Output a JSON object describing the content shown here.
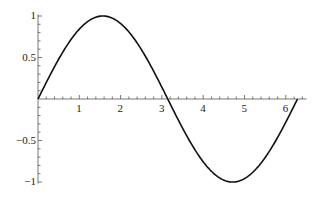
{
  "chart_data": {
    "type": "line",
    "title": "",
    "xlabel": "",
    "ylabel": "",
    "function": "sin(x)",
    "x_range": [
      0,
      6.2832
    ],
    "xlim": [
      0,
      6.5
    ],
    "ylim": [
      -1,
      1
    ],
    "grid": false,
    "legend": null,
    "x_ticks": [
      1,
      2,
      3,
      4,
      5,
      6
    ],
    "x_tick_labels": [
      "1",
      "2",
      "3",
      "4",
      "5",
      "6"
    ],
    "y_ticks": [
      -1,
      -0.5,
      0.5,
      1
    ],
    "y_tick_labels": [
      "-1",
      "-0.5",
      "0.5",
      "1"
    ],
    "series": [
      {
        "name": "sin(x)",
        "color": "#111111",
        "x": [
          0,
          0.5,
          1.0,
          1.5708,
          2.0,
          2.5,
          3.1416,
          3.5,
          4.0,
          4.7124,
          5.0,
          5.5,
          6.0,
          6.2832
        ],
        "y": [
          0,
          0.479,
          0.841,
          1.0,
          0.909,
          0.598,
          0,
          -0.351,
          -0.757,
          -1.0,
          -0.959,
          -0.706,
          -0.279,
          0
        ]
      }
    ]
  }
}
